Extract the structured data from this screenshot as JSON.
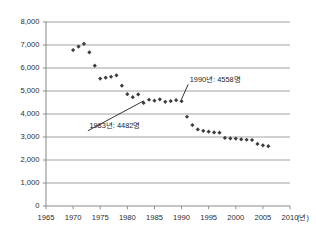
{
  "chart_data": {
    "type": "scatter",
    "title": "",
    "xlabel": "(년)",
    "ylabel": "",
    "xlim": [
      1965,
      2010
    ],
    "ylim": [
      0,
      8000
    ],
    "grid": true,
    "legend": null,
    "x_ticks": [
      "1965",
      "1970",
      "1975",
      "1980",
      "1985",
      "1990",
      "1995",
      "2000",
      "2005",
      "2010"
    ],
    "x_tick_values": [
      1965,
      1970,
      1975,
      1980,
      1985,
      1990,
      1995,
      2000,
      2005,
      2010
    ],
    "y_ticks": [
      "0",
      "1,000",
      "2,000",
      "3,000",
      "4,000",
      "5,000",
      "6,000",
      "7,000",
      "8,000"
    ],
    "y_tick_values": [
      0,
      1000,
      2000,
      3000,
      4000,
      5000,
      6000,
      7000,
      8000
    ],
    "series": [
      {
        "name": "연간 수치",
        "marker": "diamond",
        "color": "#3d3d3d",
        "x": [
          1970,
          1971,
          1972,
          1973,
          1974,
          1975,
          1976,
          1977,
          1978,
          1979,
          1980,
          1981,
          1982,
          1983,
          1984,
          1985,
          1986,
          1987,
          1988,
          1989,
          1990,
          1991,
          1992,
          1993,
          1994,
          1995,
          1996,
          1997,
          1998,
          1999,
          2000,
          2001,
          2002,
          2003,
          2004,
          2005,
          2006
        ],
        "y": [
          6780,
          6930,
          7050,
          6680,
          6100,
          5540,
          5580,
          5620,
          5680,
          5230,
          4860,
          4730,
          4850,
          4482,
          4620,
          4580,
          4640,
          4530,
          4560,
          4600,
          4558,
          3880,
          3520,
          3330,
          3270,
          3230,
          3200,
          3190,
          2960,
          2940,
          2930,
          2900,
          2880,
          2870,
          2700,
          2640,
          2600
        ]
      }
    ],
    "annotations": [
      {
        "label": "1990년: 4558명",
        "text_x": 1991.5,
        "text_y": 5400,
        "point_x": 1990,
        "point_y": 4558
      },
      {
        "label": "1983년: 4482명",
        "text_x": 1973.0,
        "text_y": 3380,
        "point_x": 1983,
        "point_y": 4482
      }
    ]
  },
  "colors": {
    "marker": "#3d3d3d",
    "gridline": "#8c8c8c",
    "axis": "#7a7a7a",
    "background": "#ffffff",
    "text": "#2b2b2b"
  }
}
